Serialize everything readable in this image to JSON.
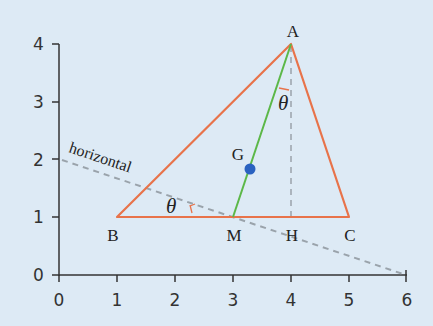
{
  "diagram": {
    "x_axis": {
      "ticks": [
        "0",
        "1",
        "2",
        "3",
        "4",
        "5",
        "6"
      ],
      "range": [
        0,
        6
      ]
    },
    "y_axis": {
      "ticks": [
        "0",
        "1",
        "2",
        "3",
        "4"
      ],
      "range": [
        0,
        4
      ]
    },
    "points": {
      "A": {
        "label": "A",
        "x": 4,
        "y": 4
      },
      "B": {
        "label": "B",
        "x": 1,
        "y": 1
      },
      "C": {
        "label": "C",
        "x": 5,
        "y": 1
      },
      "M": {
        "label": "M",
        "x": 3,
        "y": 1
      },
      "H": {
        "label": "H",
        "x": 4,
        "y": 1
      },
      "G": {
        "label": "G",
        "x": 3.33,
        "y": 1.83
      }
    },
    "angle_label_bottom": "θ",
    "angle_label_top": "θ",
    "horizontal_label": "horizontal",
    "colors": {
      "background": "#ddeaf5",
      "triangle": "#e8734a",
      "median": "#5cb848",
      "centroid": "#2a62c0",
      "dashed": "#9aa3ab",
      "axis": "#333333"
    }
  }
}
